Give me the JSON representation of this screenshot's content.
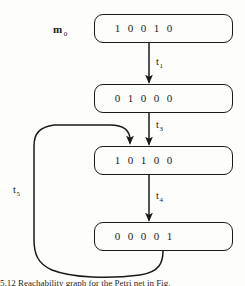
{
  "figure": {
    "type": "petri-net-reachability-sequence",
    "initial_marking_label": "m",
    "initial_marking_subscript": "0",
    "caption_partial": "5.12  Reachability graph for the Petri net in Fig."
  },
  "nodes": [
    {
      "id": "m0",
      "name": "marking-box-m0",
      "digits": [
        "1",
        "0",
        "0",
        "1",
        "0"
      ],
      "vector_text": "1 0 0 1 0",
      "x": 94,
      "y": 14,
      "w": 139,
      "h": 29
    },
    {
      "id": "m1",
      "name": "marking-box-m1",
      "digits": [
        "0",
        "1",
        "0",
        "0",
        "0"
      ],
      "vector_text": "0 1 0 0 0",
      "x": 94,
      "y": 84,
      "w": 139,
      "h": 29
    },
    {
      "id": "m2",
      "name": "marking-box-m2",
      "digits": [
        "1",
        "0",
        "1",
        "0",
        "0"
      ],
      "vector_text": "1 0 1 0 0",
      "x": 94,
      "y": 146,
      "w": 139,
      "h": 29
    },
    {
      "id": "m3",
      "name": "marking-box-m3",
      "digits": [
        "0",
        "0",
        "0",
        "0",
        "1"
      ],
      "vector_text": "0 0 0 0 1",
      "x": 94,
      "y": 222,
      "w": 139,
      "h": 29
    }
  ],
  "transitions": [
    {
      "id": "t1",
      "label": "t",
      "subscript": "1",
      "from": "m0",
      "to": "m1",
      "label_x": 156,
      "label_y": 57
    },
    {
      "id": "t3",
      "label": "t",
      "subscript": "3",
      "from": "m1",
      "to": "m2",
      "label_x": 156,
      "label_y": 120
    },
    {
      "id": "t4",
      "label": "t",
      "subscript": "4",
      "from": "m2",
      "to": "m3",
      "label_x": 156,
      "label_y": 191
    },
    {
      "id": "t5",
      "label": "t",
      "subscript": "5",
      "from": "m3",
      "to": "m2",
      "label_x": 13,
      "label_y": 185
    }
  ],
  "colors": {
    "stroke": "#1a1a1a",
    "background": "#fdfdfc",
    "text": "#1a1a1a"
  }
}
